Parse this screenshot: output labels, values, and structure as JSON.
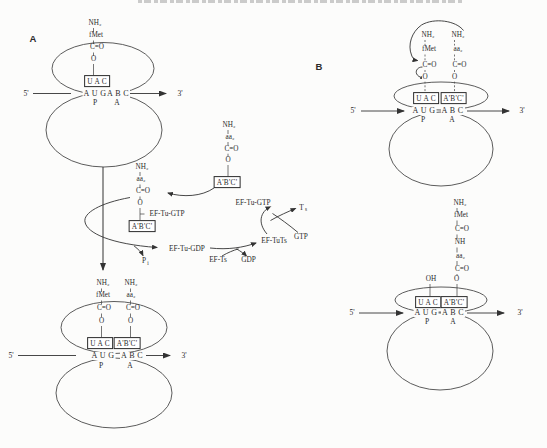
{
  "colors": {
    "ink": "#2b2b2b",
    "line": "#454545",
    "paper": "#fcfcfb",
    "artifact": "#9a9a9a"
  },
  "labels": [
    {
      "name": "panel-a-label",
      "t": "A",
      "x": 33,
      "y": 39,
      "c": "p"
    },
    {
      "name": "r1-amine",
      "t": "NH₂",
      "x": 95,
      "y": 24,
      "c": "c"
    },
    {
      "name": "r1-fmet",
      "t": "fMet",
      "x": 96,
      "y": 36,
      "c": "c"
    },
    {
      "name": "r1-carbonyl",
      "t": "C=O",
      "x": 97,
      "y": 48,
      "c": "c"
    },
    {
      "name": "r1-ester-o",
      "t": "O",
      "x": 93.5,
      "y": 60,
      "c": "c"
    },
    {
      "name": "r1-anticodon-box-uac",
      "t": "U A C",
      "x": 97,
      "y": 81,
      "c": "b"
    },
    {
      "name": "r1-codon-aug",
      "t": "A U G",
      "x": 95,
      "y": 93.5,
      "c": "k"
    },
    {
      "name": "r1-codon-abc",
      "t": "A B C",
      "x": 118,
      "y": 93.5,
      "c": "k"
    },
    {
      "name": "r1-p-site",
      "t": "P",
      "x": 95,
      "y": 103,
      "c": "s"
    },
    {
      "name": "r1-a-site",
      "t": "A",
      "x": 117,
      "y": 103,
      "c": "s"
    },
    {
      "name": "r1-five-prime",
      "t": "5'",
      "x": 26,
      "y": 93.5,
      "c": "s"
    },
    {
      "name": "r1-three-prime",
      "t": "3'",
      "x": 180,
      "y": 93.5,
      "c": "s"
    },
    {
      "name": "r2-amine-1",
      "t": "NH₂",
      "x": 103,
      "y": 284,
      "c": "c"
    },
    {
      "name": "r2-fmet",
      "t": "fMet",
      "x": 103,
      "y": 296,
      "c": "c"
    },
    {
      "name": "r2-carbonyl-1",
      "t": "C=O",
      "x": 104,
      "y": 309,
      "c": "c"
    },
    {
      "name": "r2-ester-o-1",
      "t": "O",
      "x": 101.5,
      "y": 322,
      "c": "c"
    },
    {
      "name": "r2-amine-2",
      "t": "NH₂",
      "x": 131,
      "y": 284,
      "c": "c"
    },
    {
      "name": "r2-aa2",
      "t": "aa₂",
      "x": 131,
      "y": 296,
      "c": "c"
    },
    {
      "name": "r2-carbonyl-2",
      "t": "C=O",
      "x": 133,
      "y": 309,
      "c": "c"
    },
    {
      "name": "r2-ester-o-2",
      "t": "O",
      "x": 130.5,
      "y": 322,
      "c": "c"
    },
    {
      "name": "r2-anticodon-box-uac",
      "t": "U A C",
      "x": 100,
      "y": 343,
      "c": "b"
    },
    {
      "name": "r2-anticodon-box-abc",
      "t": "A'B'C'",
      "x": 127,
      "y": 343,
      "c": "b"
    },
    {
      "name": "r2-codon-aug",
      "t": "A U G",
      "x": 103,
      "y": 355.5,
      "c": "k"
    },
    {
      "name": "r2-codon-abc",
      "t": "A B C",
      "x": 132,
      "y": 355.5,
      "c": "k"
    },
    {
      "name": "r2-p-site",
      "t": "P",
      "x": 101,
      "y": 366,
      "c": "s"
    },
    {
      "name": "r2-a-site",
      "t": "A",
      "x": 130,
      "y": 366,
      "c": "s"
    },
    {
      "name": "r2-five-prime",
      "t": "5'",
      "x": 11,
      "y": 355.5,
      "c": "s"
    },
    {
      "name": "r2-three-prime",
      "t": "3'",
      "x": 184,
      "y": 355.5,
      "c": "s"
    },
    {
      "name": "tc-amine",
      "t": "NH₂",
      "x": 142,
      "y": 168,
      "c": "c"
    },
    {
      "name": "tc-aa2",
      "t": "aa₂",
      "x": 141,
      "y": 180,
      "c": "c"
    },
    {
      "name": "tc-carbonyl",
      "t": "C=O",
      "x": 143,
      "y": 192,
      "c": "c"
    },
    {
      "name": "tc-ester-o",
      "t": "O",
      "x": 140,
      "y": 204,
      "c": "c"
    },
    {
      "name": "tc-ef-tu-gtp",
      "t": "EF-Tu-GTP",
      "x": 167,
      "y": 214,
      "c": "e"
    },
    {
      "name": "tc-anticodon-box",
      "t": "A'B'C'",
      "x": 142,
      "y": 226,
      "c": "b"
    },
    {
      "name": "ft-amine",
      "t": "NH₂",
      "x": 229,
      "y": 126,
      "c": "c"
    },
    {
      "name": "ft-aa2",
      "t": "aa₂",
      "x": 230,
      "y": 138,
      "c": "c"
    },
    {
      "name": "ft-carbonyl",
      "t": "C=O",
      "x": 231.5,
      "y": 149.5,
      "c": "c"
    },
    {
      "name": "ft-ester-o",
      "t": "O",
      "x": 228,
      "y": 161,
      "c": "c"
    },
    {
      "name": "ft-anticodon-box",
      "t": "A'B'C'",
      "x": 227,
      "y": 182,
      "c": "b"
    },
    {
      "name": "cycle-ef-tu-gtp",
      "t": "EF-Tu-GTP",
      "x": 253,
      "y": 202.5,
      "c": "e"
    },
    {
      "name": "cycle-ef-tu-gdp",
      "t": "EF-Tu-GDP",
      "x": 187,
      "y": 248.5,
      "c": "e"
    },
    {
      "name": "cycle-ef-ts",
      "t": "EF-Ts",
      "x": 218,
      "y": 259.5,
      "c": "e"
    },
    {
      "name": "cycle-gdp",
      "t": "GDP",
      "x": 248.5,
      "y": 259.5,
      "c": "e"
    },
    {
      "name": "cycle-ef-tuts",
      "t": "EF-TuTs",
      "x": 274,
      "y": 240.5,
      "c": "e"
    },
    {
      "name": "cycle-gtp",
      "t": "GTP",
      "x": 301,
      "y": 237,
      "c": "e"
    },
    {
      "name": "cycle-ts-release",
      "t": "T",
      "x": 301.5,
      "y": 207.5,
      "c": "e"
    },
    {
      "name": "cycle-ts-release-sub",
      "t": "s",
      "x": 306,
      "y": 210,
      "c": "i"
    },
    {
      "name": "cycle-pi",
      "t": "P",
      "x": 144,
      "y": 261,
      "c": "e"
    },
    {
      "name": "cycle-pi-sub",
      "t": "i",
      "x": 148,
      "y": 263.5,
      "c": "i"
    },
    {
      "name": "panel-b-label",
      "t": "B",
      "x": 319,
      "y": 67,
      "c": "p"
    },
    {
      "name": "r3-amine-1",
      "t": "NH₂",
      "x": 428,
      "y": 36,
      "c": "c"
    },
    {
      "name": "r3-fmet",
      "t": "fMet",
      "x": 429,
      "y": 50,
      "c": "c"
    },
    {
      "name": "r3-carbonyl-1",
      "t": "C=O",
      "x": 429.5,
      "y": 66,
      "c": "c"
    },
    {
      "name": "r3-ester-o-1",
      "t": "O",
      "x": 425,
      "y": 77.5,
      "c": "c"
    },
    {
      "name": "r3-amine-2",
      "t": "NH₂",
      "x": 458,
      "y": 36,
      "c": "c"
    },
    {
      "name": "r3-aa2",
      "t": "aa₂",
      "x": 458,
      "y": 50,
      "c": "c"
    },
    {
      "name": "r3-carbonyl-2",
      "t": "C=O",
      "x": 459.5,
      "y": 66,
      "c": "c"
    },
    {
      "name": "r3-ester-o-2",
      "t": "O",
      "x": 454.5,
      "y": 77.5,
      "c": "c"
    },
    {
      "name": "r3-anticodon-box-uac",
      "t": "U A C",
      "x": 426,
      "y": 98,
      "c": "b"
    },
    {
      "name": "r3-anticodon-box-abc",
      "t": "A'B'C'",
      "x": 453.5,
      "y": 98,
      "c": "b"
    },
    {
      "name": "r3-codon-aug",
      "t": "A U G",
      "x": 424,
      "y": 111,
      "c": "k"
    },
    {
      "name": "r3-codon-abc",
      "t": "A B C",
      "x": 452.5,
      "y": 111,
      "c": "k"
    },
    {
      "name": "r3-p-site",
      "t": "P",
      "x": 423,
      "y": 119.5,
      "c": "s"
    },
    {
      "name": "r3-a-site",
      "t": "A",
      "x": 452,
      "y": 119.5,
      "c": "s"
    },
    {
      "name": "r3-five-prime",
      "t": "5'",
      "x": 353,
      "y": 111,
      "c": "s"
    },
    {
      "name": "r3-three-prime",
      "t": "3'",
      "x": 522,
      "y": 111,
      "c": "s"
    },
    {
      "name": "r4-amine",
      "t": "NH₂",
      "x": 460,
      "y": 204,
      "c": "c"
    },
    {
      "name": "r4-fmet",
      "t": "fMet",
      "x": 461,
      "y": 216,
      "c": "c"
    },
    {
      "name": "r4-carbonyl-1",
      "t": "C=O",
      "x": 462,
      "y": 230,
      "c": "c"
    },
    {
      "name": "r4-amide-nh",
      "t": "NH",
      "x": 460,
      "y": 243,
      "c": "c"
    },
    {
      "name": "r4-aa2",
      "t": "aa₂",
      "x": 460.5,
      "y": 257,
      "c": "c"
    },
    {
      "name": "r4-carbonyl-2",
      "t": "C=O",
      "x": 462,
      "y": 270,
      "c": "c"
    },
    {
      "name": "r4-ester-o",
      "t": "O",
      "x": 456.5,
      "y": 280,
      "c": "c"
    },
    {
      "name": "r4-hydroxyl",
      "t": "OH",
      "x": 431,
      "y": 280,
      "c": "c"
    },
    {
      "name": "r4-anticodon-box-uac",
      "t": "U A C",
      "x": 428,
      "y": 302,
      "c": "b"
    },
    {
      "name": "r4-anticodon-box-abc",
      "t": "A'B'C'",
      "x": 454,
      "y": 302,
      "c": "b"
    },
    {
      "name": "r4-codon-aug",
      "t": "A U G",
      "x": 426,
      "y": 313,
      "c": "k"
    },
    {
      "name": "r4-codon-abc",
      "t": "A B C",
      "x": 453,
      "y": 313,
      "c": "k"
    },
    {
      "name": "r4-p-site",
      "t": "P",
      "x": 427,
      "y": 321.5,
      "c": "s"
    },
    {
      "name": "r4-a-site",
      "t": "A",
      "x": 453,
      "y": 321.5,
      "c": "s"
    },
    {
      "name": "r4-five-prime",
      "t": "5'",
      "x": 352,
      "y": 313,
      "c": "s"
    },
    {
      "name": "r4-three-prime",
      "t": "3'",
      "x": 520,
      "y": 313,
      "c": "s"
    }
  ]
}
